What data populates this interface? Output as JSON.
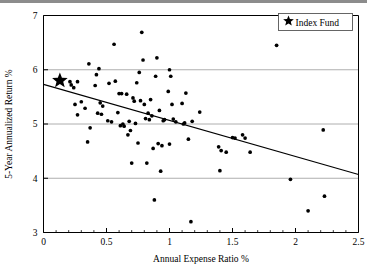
{
  "chart_data": {
    "type": "scatter",
    "title": "",
    "xlabel": "Annual Expense Ratio %",
    "ylabel": "5-Year Annualized Return %",
    "xlim": [
      0,
      2.5
    ],
    "ylim": [
      3,
      7
    ],
    "xticks": [
      0,
      0.5,
      1,
      1.5,
      2,
      2.5
    ],
    "xtick_labels": [
      "0",
      "0.5",
      "1",
      "1.5",
      "2",
      "2.5"
    ],
    "yticks": [
      3,
      4,
      5,
      6,
      7
    ],
    "ytick_labels": [
      "3",
      "4",
      "5",
      "6",
      "7"
    ],
    "xminor_ticks": [
      0.1,
      0.2,
      0.3,
      0.4,
      0.6,
      0.7,
      0.8,
      0.9,
      1.1,
      1.2,
      1.3,
      1.4,
      1.6,
      1.7,
      1.8,
      1.9,
      2.1,
      2.2,
      2.3,
      2.4
    ],
    "grid": "horizontal",
    "gridlines_y": [
      4,
      5,
      6
    ],
    "legend_position": "top-right",
    "legend": [
      {
        "label": "Index Fund",
        "marker": "star",
        "color": "#000000"
      }
    ],
    "series": [
      {
        "name": "Actively Managed Funds",
        "marker": "circle",
        "color": "#000000",
        "points": [
          [
            0.21,
            5.78
          ],
          [
            0.24,
            5.67
          ],
          [
            0.27,
            5.78
          ],
          [
            0.22,
            5.72
          ],
          [
            0.25,
            5.36
          ],
          [
            0.3,
            5.41
          ],
          [
            0.27,
            5.17
          ],
          [
            0.36,
            6.11
          ],
          [
            0.37,
            4.93
          ],
          [
            0.35,
            4.67
          ],
          [
            0.33,
            5.29
          ],
          [
            0.42,
            5.91
          ],
          [
            0.44,
            6.02
          ],
          [
            0.41,
            5.71
          ],
          [
            0.45,
            5.39
          ],
          [
            0.43,
            5.2
          ],
          [
            0.47,
            5.33
          ],
          [
            0.46,
            5.18
          ],
          [
            0.52,
            5.75
          ],
          [
            0.54,
            5.04
          ],
          [
            0.51,
            5.06
          ],
          [
            0.57,
            5.79
          ],
          [
            0.56,
            6.47
          ],
          [
            0.6,
            5.56
          ],
          [
            0.62,
            5.56
          ],
          [
            0.59,
            5.21
          ],
          [
            0.63,
            5.0
          ],
          [
            0.61,
            4.97
          ],
          [
            0.64,
            4.96
          ],
          [
            0.66,
            5.55
          ],
          [
            0.68,
            5.05
          ],
          [
            0.67,
            4.8
          ],
          [
            0.69,
            4.88
          ],
          [
            0.7,
            4.28
          ],
          [
            0.71,
            5.48
          ],
          [
            0.72,
            5.42
          ],
          [
            0.73,
            5.01
          ],
          [
            0.74,
            5.76
          ],
          [
            0.76,
            5.95
          ],
          [
            0.77,
            5.43
          ],
          [
            0.75,
            4.65
          ],
          [
            0.78,
            6.69
          ],
          [
            0.79,
            6.18
          ],
          [
            0.8,
            5.36
          ],
          [
            0.81,
            5.1
          ],
          [
            0.82,
            4.28
          ],
          [
            0.83,
            5.2
          ],
          [
            0.85,
            5.45
          ],
          [
            0.84,
            5.08
          ],
          [
            0.86,
            5.15
          ],
          [
            0.88,
            3.6
          ],
          [
            0.87,
            4.55
          ],
          [
            0.89,
            5.88
          ],
          [
            0.9,
            6.22
          ],
          [
            0.91,
            4.64
          ],
          [
            0.92,
            5.25
          ],
          [
            0.93,
            4.13
          ],
          [
            0.94,
            4.6
          ],
          [
            0.95,
            5.06
          ],
          [
            0.96,
            5.08
          ],
          [
            0.99,
            5.6
          ],
          [
            1.0,
            6.0
          ],
          [
            1.01,
            5.88
          ],
          [
            1.02,
            5.36
          ],
          [
            1.0,
            4.63
          ],
          [
            1.03,
            5.09
          ],
          [
            1.05,
            5.04
          ],
          [
            1.1,
            5.38
          ],
          [
            1.12,
            5.02
          ],
          [
            1.11,
            5.0
          ],
          [
            1.13,
            5.57
          ],
          [
            1.15,
            4.72
          ],
          [
            1.17,
            3.2
          ],
          [
            1.18,
            5.05
          ],
          [
            1.24,
            5.22
          ],
          [
            1.4,
            4.14
          ],
          [
            1.41,
            4.51
          ],
          [
            1.39,
            4.58
          ],
          [
            1.45,
            4.48
          ],
          [
            1.5,
            4.75
          ],
          [
            1.52,
            4.74
          ],
          [
            1.58,
            4.8
          ],
          [
            1.6,
            4.74
          ],
          [
            1.64,
            4.48
          ],
          [
            1.85,
            6.45
          ],
          [
            1.96,
            3.98
          ],
          [
            2.1,
            3.4
          ],
          [
            2.22,
            4.89
          ],
          [
            2.23,
            3.67
          ]
        ]
      }
    ],
    "index_fund": {
      "x": 0.13,
      "y": 5.8,
      "label": "Index Fund"
    },
    "trendline": {
      "x0": 0,
      "y0": 5.73,
      "x1": 2.5,
      "y1": 4.07,
      "description": "negative linear fit"
    }
  }
}
